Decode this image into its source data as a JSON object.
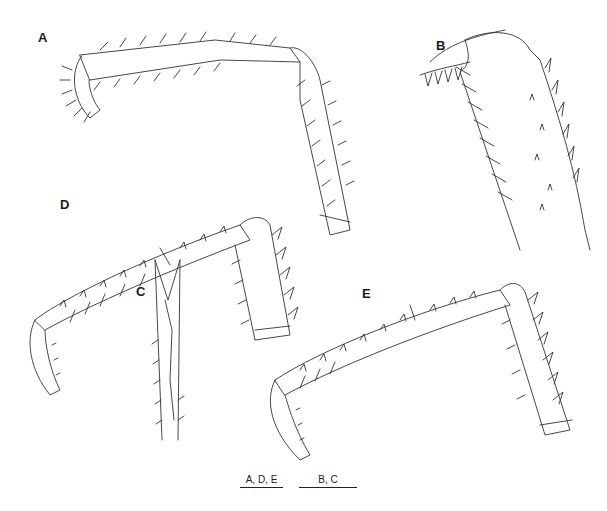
{
  "figure": {
    "panels": [
      {
        "id": "A",
        "label": "A"
      },
      {
        "id": "B",
        "label": "B"
      },
      {
        "id": "C",
        "label": "C"
      },
      {
        "id": "D",
        "label": "D"
      },
      {
        "id": "E",
        "label": "E"
      }
    ],
    "scale_bars": [
      {
        "label": "A, D, E"
      },
      {
        "label": "B, C"
      }
    ],
    "line_color": "#333333",
    "background": "#ffffff"
  }
}
